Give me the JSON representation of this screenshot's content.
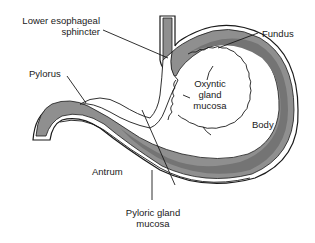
{
  "diagram": {
    "colors": {
      "wall_fill": "#8f8f8f",
      "mucosa_band": "#7a7a7a",
      "outline": "#1a1a1a",
      "serosa": "#ffffff"
    },
    "labels": {
      "les_line1": "Lower esophageal",
      "les_line2": "sphincter",
      "fundus": "Fundus",
      "pylorus": "Pylorus",
      "oxyntic_line1": "Oxyntic",
      "oxyntic_line2": "gland",
      "oxyntic_line3": "mucosa",
      "body": "Body",
      "antrum": "Antrum",
      "pyloric_line1": "Pyloric gland",
      "pyloric_line2": "mucosa"
    }
  }
}
